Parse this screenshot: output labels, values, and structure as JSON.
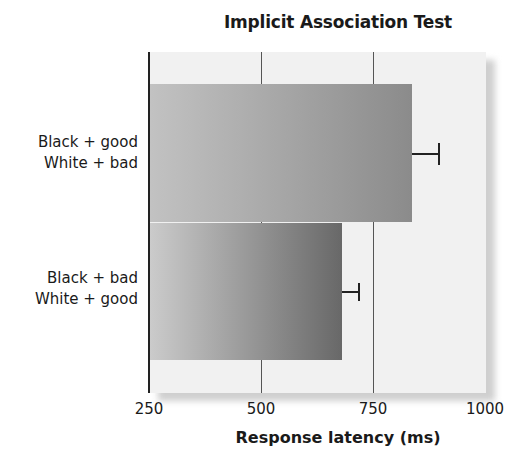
{
  "chart_data": {
    "type": "bar",
    "orientation": "horizontal",
    "title": "Implicit Association Test",
    "xlabel": "Response latency (ms)",
    "ylabel": "",
    "categories": [
      "Black + good\nWhite + bad",
      "Black + bad\nWhite + good"
    ],
    "category_lines": [
      [
        "Black + good",
        "White + bad"
      ],
      [
        "Black + bad",
        "White + good"
      ]
    ],
    "values": [
      837,
      681
    ],
    "error": [
      60,
      38
    ],
    "xlim": [
      250,
      1000
    ],
    "xticks": [
      250,
      500,
      750,
      1000
    ],
    "grid": true,
    "legend": null
  },
  "colors": {
    "panel_bg": "#f1f1f1",
    "bar1_start": "#c2c2c2",
    "bar1_end": "#8b8b8b",
    "bar2_start": "#cbcbcb",
    "bar2_end": "#686868",
    "axis": "#222222"
  },
  "labels": {
    "title": "Implicit Association Test",
    "xlabel": "Response latency (ms)",
    "cat1_line1": "Black + good",
    "cat1_line2": "White + bad",
    "cat2_line1": "Black + bad",
    "cat2_line2": "White + good",
    "tick_250": "250",
    "tick_500": "500",
    "tick_750": "750",
    "tick_1000": "1000"
  }
}
